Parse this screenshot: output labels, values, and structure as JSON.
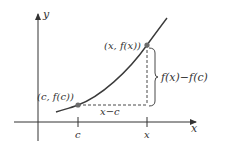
{
  "diagram": {
    "colors": {
      "ink": "#333333",
      "curve": "#3a3a3a",
      "point": "#6b6b6b",
      "background": "#ffffff"
    },
    "axes": {
      "x_label": "x",
      "y_label": "y"
    },
    "ticks": {
      "c_label": "c",
      "x_label": "x"
    },
    "points": {
      "left": {
        "label": "(c, f(c))"
      },
      "right": {
        "label": "(x, f(x))"
      }
    },
    "annotations": {
      "horizontal_gap": "x−c",
      "vertical_gap": "f(x)−f(c)"
    }
  }
}
